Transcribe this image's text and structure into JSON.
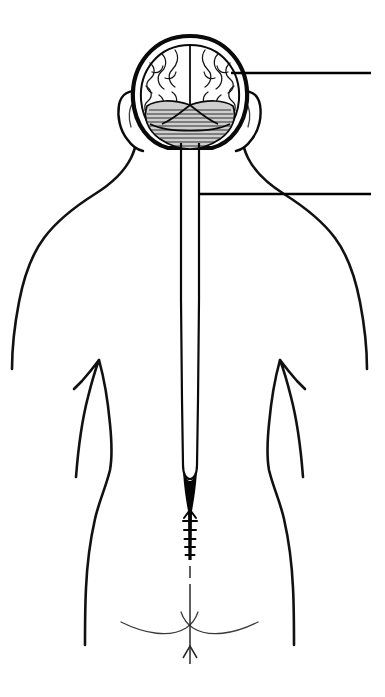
{
  "figure": {
    "view": "posterior",
    "style": "black-and-white line drawing",
    "background_color": "#ffffff",
    "line_color": "#0a0a0a"
  },
  "canvas": {
    "width": 385,
    "height": 697
  },
  "structures": [
    {
      "id": "skull",
      "name": "skull",
      "label": "",
      "description": "cranium outline seen from behind"
    },
    {
      "id": "cerebrum",
      "name": "cerebrum",
      "label": "",
      "description": "two cerebral hemispheres with gyri and sulci, divided by longitudinal fissure"
    },
    {
      "id": "cerebellum",
      "name": "cerebellum",
      "label": "",
      "description": "hatched folia below the cerebral hemispheres"
    },
    {
      "id": "spinal-cord",
      "name": "spinal cord",
      "label": "",
      "description": "paired vertical lines running from brainstem down the back"
    },
    {
      "id": "conus-medullaris",
      "name": "conus medullaris",
      "label": "",
      "description": "tapered solid termination of the spinal cord"
    },
    {
      "id": "cauda-equina",
      "name": "cauda equina",
      "label": "",
      "description": "bundle of nerve roots below the conus"
    },
    {
      "id": "filum-terminale",
      "name": "filum terminale",
      "label": "",
      "description": "thin dashed filament continuing to the coccyx"
    },
    {
      "id": "torso",
      "name": "torso outline",
      "label": "",
      "description": "posterior body contour: neck, shoulders, arms, waist, hips"
    },
    {
      "id": "gluteal-cleft",
      "name": "gluteal cleft",
      "label": "",
      "description": "curved lines meeting at the natal cleft"
    }
  ],
  "leaders": [
    {
      "id": "leader-brain",
      "points_to": "brain",
      "label": "",
      "anchor_x": 231,
      "anchor_y": 73,
      "end_x": 371,
      "end_y": 73
    },
    {
      "id": "leader-spinal-cord",
      "points_to": "spinal cord",
      "label": "",
      "anchor_x": 199,
      "anchor_y": 194,
      "end_x": 371,
      "end_y": 194
    }
  ]
}
